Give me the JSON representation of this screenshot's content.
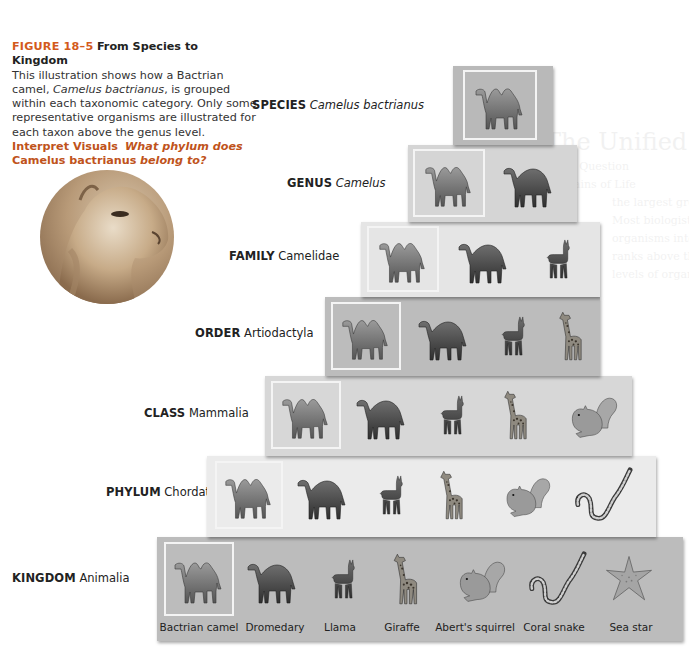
{
  "caption": {
    "figure_number": "FIGURE 18–5",
    "figure_title": "From Species to Kingdom",
    "body_1": "This illustration shows how a Bactrian camel, ",
    "body_species": "Camelus bactrianus",
    "body_2": ", is grouped within each taxonomic category. Only some representative organisms are illustrated for each taxon above the genus level.",
    "interpret_label": "Interpret Visuals",
    "question_1": "What phylum does",
    "question_name": "Camelus bactrianus",
    "question_2": "belong to?"
  },
  "background_ghost": {
    "heading": "The Unified",
    "lines": [
      "Key Question",
      "Domains of Life",
      "the largest group",
      "Most biologists",
      "organisms into",
      "ranks above the",
      "levels of organ"
    ]
  },
  "tiers": [
    {
      "rank": "SPECIES",
      "taxon": "Camelus bactrianus",
      "taxon_italic": true,
      "color": "#b9b9b9",
      "organisms": [
        "bactrian-camel"
      ]
    },
    {
      "rank": "GENUS",
      "taxon": "Camelus",
      "taxon_italic": true,
      "color": "#d5d5d5",
      "organisms": [
        "bactrian-camel",
        "dromedary"
      ]
    },
    {
      "rank": "FAMILY",
      "taxon": "Camelidae",
      "taxon_italic": false,
      "color": "#e5e5e5",
      "organisms": [
        "bactrian-camel",
        "dromedary",
        "llama"
      ]
    },
    {
      "rank": "ORDER",
      "taxon": "Artiodactyla",
      "taxon_italic": false,
      "color": "#bcbcbc",
      "organisms": [
        "bactrian-camel",
        "dromedary",
        "llama",
        "giraffe"
      ]
    },
    {
      "rank": "CLASS",
      "taxon": "Mammalia",
      "taxon_italic": false,
      "color": "#d7d7d7",
      "organisms": [
        "bactrian-camel",
        "dromedary",
        "llama",
        "giraffe",
        "aberts-squirrel"
      ]
    },
    {
      "rank": "PHYLUM",
      "taxon": "Chordata",
      "taxon_italic": false,
      "color": "#ebebeb",
      "organisms": [
        "bactrian-camel",
        "dromedary",
        "llama",
        "giraffe",
        "aberts-squirrel",
        "coral-snake"
      ]
    },
    {
      "rank": "KINGDOM",
      "taxon": "Animalia",
      "taxon_italic": false,
      "color": "#bcbcbc",
      "organisms": [
        "bactrian-camel",
        "dromedary",
        "llama",
        "giraffe",
        "aberts-squirrel",
        "coral-snake",
        "sea-star"
      ]
    }
  ],
  "organism_labels": [
    "Bactrian camel",
    "Dromedary",
    "Llama",
    "Giraffe",
    "Abert's squirrel",
    "Coral snake",
    "Sea star"
  ],
  "colors": {
    "figure_number": "#d35a1c",
    "interpret_visuals": "#c0531b",
    "highlight_frame": "#f4f4f4"
  }
}
